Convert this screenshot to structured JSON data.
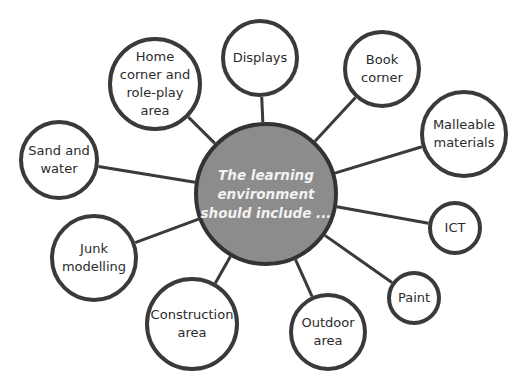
{
  "hub": {
    "label": "The learning\nenvironment\nshould include ...",
    "cx": 266,
    "cy": 194,
    "r": 72,
    "fill": "#8c8c8c"
  },
  "nodes": [
    {
      "id": "home-corner",
      "label": "Home\ncorner and\nrole-play\narea",
      "cx": 155,
      "cy": 84,
      "r": 47
    },
    {
      "id": "displays",
      "label": "Displays",
      "cx": 260,
      "cy": 58,
      "r": 39
    },
    {
      "id": "book-corner",
      "label": "Book\ncorner",
      "cx": 382,
      "cy": 69,
      "r": 39
    },
    {
      "id": "malleable-materials",
      "label": "Malleable\nmaterials",
      "cx": 464,
      "cy": 134,
      "r": 44
    },
    {
      "id": "sand-and-water",
      "label": "Sand and\nwater",
      "cx": 59,
      "cy": 160,
      "r": 40
    },
    {
      "id": "junk-modelling",
      "label": "Junk\nmodelling",
      "cx": 94,
      "cy": 258,
      "r": 44
    },
    {
      "id": "ict",
      "label": "ICT",
      "cx": 455,
      "cy": 228,
      "r": 27
    },
    {
      "id": "paint",
      "label": "Paint",
      "cx": 414,
      "cy": 298,
      "r": 27
    },
    {
      "id": "construction-area",
      "label": "Construction\narea",
      "cx": 192,
      "cy": 324,
      "r": 47
    },
    {
      "id": "outdoor-area",
      "label": "Outdoor\narea",
      "cx": 328,
      "cy": 332,
      "r": 39
    }
  ],
  "colors": {
    "stroke": "#3a3a3a",
    "hub_fill": "#8c8c8c",
    "hub_text": "#f2f2f2",
    "node_fill": "#ffffff"
  }
}
